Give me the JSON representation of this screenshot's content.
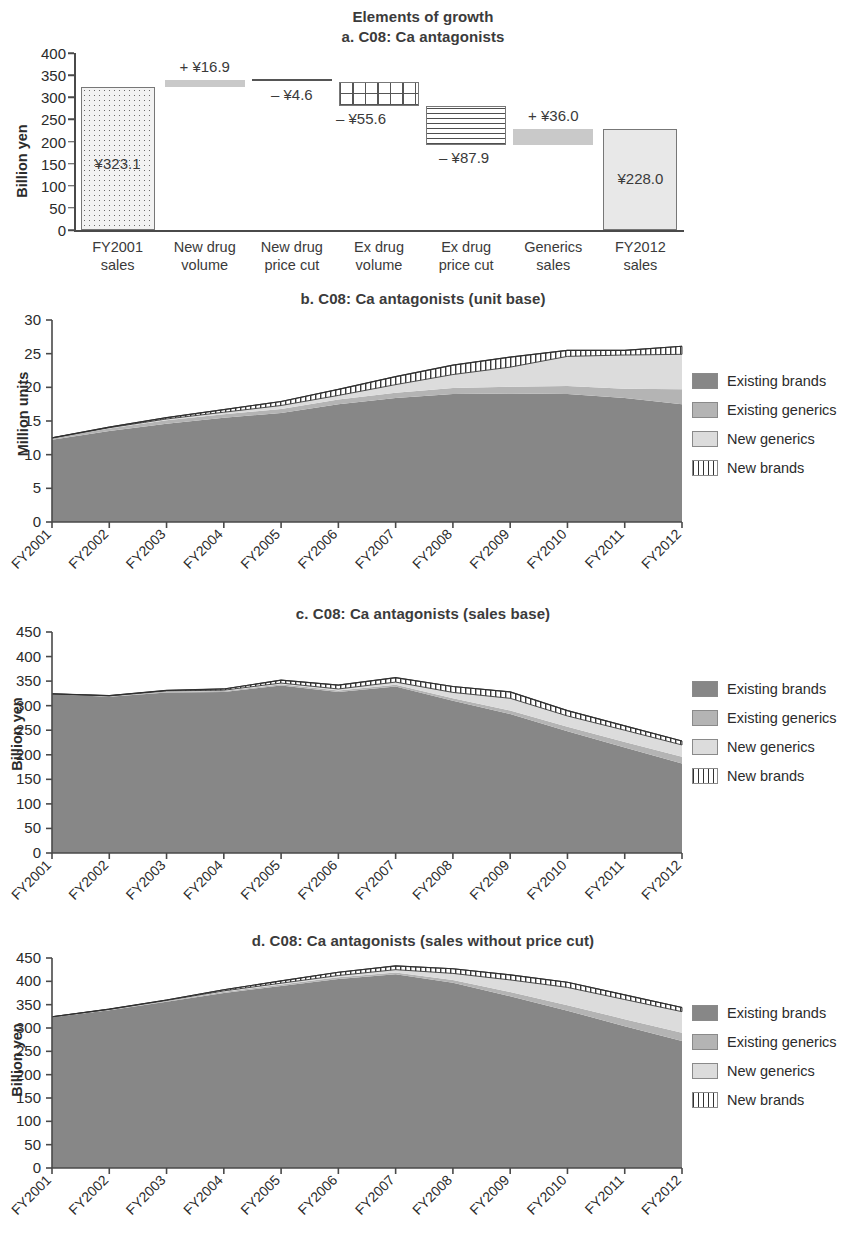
{
  "figure": {
    "main_title": "Elements of growth"
  },
  "panels": {
    "a": {
      "title": "a. C08: Ca antagonists",
      "ylabel": "Billion yen",
      "yticks": [
        "400",
        "350",
        "300",
        "250",
        "200",
        "150",
        "100",
        "50",
        "0"
      ],
      "categories": [
        "FY2001\nsales",
        "New drug\nvolume",
        "New drug\nprice cut",
        "Ex drug\nvolume",
        "Ex drug\nprice cut",
        "Generics\nsales",
        "FY2012\nsales"
      ],
      "value_labels": [
        "¥323.1",
        "+ ¥16.9",
        "– ¥4.6",
        "– ¥55.6",
        "– ¥87.9",
        "+ ¥36.0",
        "¥228.0"
      ]
    },
    "b": {
      "title": "b. C08: Ca antagonists (unit base)",
      "ylabel": "Million units"
    },
    "c": {
      "title": "c. C08: Ca antagonists (sales base)",
      "ylabel": "Billion yen"
    },
    "d": {
      "title": "d. C08: Ca antagonists (sales without price cut)",
      "ylabel": "Billion yen"
    }
  },
  "legend": {
    "items": [
      {
        "label": "Existing brands",
        "fill": "f-brands"
      },
      {
        "label": "Existing generics",
        "fill": "f-exgen"
      },
      {
        "label": "New generics",
        "fill": "f-newgen"
      },
      {
        "label": "New brands",
        "fill": "f-newbrand"
      }
    ]
  },
  "colors": {
    "existing_brands": "#878787",
    "existing_generics": "#b4b4b4",
    "new_generics": "#dcdcdc",
    "new_brands": "#ffffff",
    "axis": "#4a4a4a",
    "text": "#2b2b2b"
  },
  "chart_data": [
    {
      "type": "bar",
      "panel": "a",
      "title": "a. C08: Ca antagonists",
      "subtitle": "Elements of growth",
      "chart_style": "waterfall",
      "xlabel": "",
      "ylabel": "Billion yen",
      "ylim": [
        0,
        400
      ],
      "ytick_step": 50,
      "grid": false,
      "categories": [
        "FY2001 sales",
        "New drug volume",
        "New drug price cut",
        "Ex drug volume",
        "Ex drug price cut",
        "Generics sales",
        "FY2012 sales"
      ],
      "values": [
        323.1,
        16.9,
        -4.6,
        -55.6,
        -87.9,
        36.0,
        228.0
      ],
      "value_labels": [
        "¥323.1",
        "+ ¥16.9",
        "– ¥4.6",
        "– ¥55.6",
        "– ¥87.9",
        "+ ¥36.0",
        "¥228.0"
      ],
      "kinds": [
        "total",
        "delta",
        "delta",
        "delta",
        "delta",
        "delta",
        "total"
      ],
      "bar_spans": [
        {
          "bottom": 0.0,
          "top": 323.1
        },
        {
          "bottom": 323.1,
          "top": 340.0
        },
        {
          "bottom": 335.4,
          "top": 340.0
        },
        {
          "bottom": 279.8,
          "top": 335.4
        },
        {
          "bottom": 191.9,
          "top": 279.8
        },
        {
          "bottom": 191.9,
          "top": 227.9
        },
        {
          "bottom": 0.0,
          "top": 228.0
        }
      ],
      "fills": [
        "dots",
        "solid-gray",
        "line",
        "grid",
        "horizontal-lines",
        "solid-gray",
        "noise"
      ]
    },
    {
      "type": "area",
      "panel": "b",
      "title": "b. C08: Ca antagonists (unit base)",
      "stacked": true,
      "xlabel": "",
      "ylabel": "Million units",
      "ylim": [
        0,
        30
      ],
      "ytick_step": 5,
      "grid": false,
      "legend_position": "right",
      "x": [
        "FY2001",
        "FY2002",
        "FY2003",
        "FY2004",
        "FY2005",
        "FY2006",
        "FY2007",
        "FY2008",
        "FY2009",
        "FY2010",
        "FY2011",
        "FY2012"
      ],
      "series": [
        {
          "name": "Existing brands",
          "values": [
            12.2,
            13.5,
            14.6,
            15.5,
            16.2,
            17.5,
            18.4,
            19.0,
            19.1,
            19.0,
            18.4,
            17.5
          ]
        },
        {
          "name": "Existing generics",
          "values": [
            0.3,
            0.4,
            0.5,
            0.5,
            0.6,
            0.7,
            0.8,
            0.9,
            1.0,
            1.2,
            1.4,
            2.2
          ]
        },
        {
          "name": "New generics",
          "values": [
            0.0,
            0.1,
            0.2,
            0.3,
            0.5,
            0.6,
            1.2,
            2.0,
            2.9,
            4.4,
            5.0,
            5.2
          ]
        },
        {
          "name": "New brands",
          "values": [
            0.0,
            0.1,
            0.2,
            0.4,
            0.6,
            0.9,
            1.2,
            1.4,
            1.5,
            0.9,
            0.7,
            1.2
          ]
        }
      ],
      "totals": [
        12.5,
        14.1,
        15.5,
        16.7,
        17.9,
        19.7,
        21.6,
        23.3,
        24.5,
        25.5,
        25.5,
        26.1
      ]
    },
    {
      "type": "area",
      "panel": "c",
      "title": "c. C08: Ca antagonists (sales base)",
      "stacked": true,
      "xlabel": "",
      "ylabel": "Billion yen",
      "ylim": [
        0,
        450
      ],
      "ytick_step": 50,
      "grid": false,
      "legend_position": "right",
      "x": [
        "FY2001",
        "FY2002",
        "FY2003",
        "FY2004",
        "FY2005",
        "FY2006",
        "FY2007",
        "FY2008",
        "FY2009",
        "FY2010",
        "FY2011",
        "FY2012"
      ],
      "series": [
        {
          "name": "Existing brands",
          "values": [
            323.1,
            318.0,
            327.0,
            328.0,
            341.0,
            328.0,
            339.0,
            310.0,
            283.0,
            248.0,
            215.0,
            182.0
          ]
        },
        {
          "name": "Existing generics",
          "values": [
            1.0,
            1.5,
            2.0,
            2.0,
            2.5,
            3.0,
            3.5,
            5.0,
            7.0,
            9.0,
            11.0,
            14.0
          ]
        },
        {
          "name": "New generics",
          "values": [
            0.0,
            0.5,
            1.0,
            1.5,
            2.5,
            3.0,
            5.5,
            12.0,
            25.0,
            22.0,
            24.0,
            24.0
          ]
        },
        {
          "name": "New brands",
          "values": [
            0.0,
            0.5,
            1.0,
            2.5,
            6.0,
            8.0,
            9.0,
            12.0,
            13.0,
            11.0,
            9.0,
            8.0
          ]
        }
      ],
      "totals": [
        324.1,
        320.5,
        331.0,
        334.0,
        352.0,
        342.0,
        357.0,
        339.0,
        328.0,
        290.0,
        259.0,
        228.0
      ]
    },
    {
      "type": "area",
      "panel": "d",
      "title": "d. C08: Ca antagonists (sales without price cut)",
      "stacked": true,
      "xlabel": "",
      "ylabel": "Billion yen",
      "ylim": [
        0,
        450
      ],
      "ytick_step": 50,
      "grid": false,
      "legend_position": "right",
      "x": [
        "FY2001",
        "FY2002",
        "FY2003",
        "FY2004",
        "FY2005",
        "FY2006",
        "FY2007",
        "FY2008",
        "FY2009",
        "FY2010",
        "FY2011",
        "FY2012"
      ],
      "series": [
        {
          "name": "Existing brands",
          "values": [
            323.1,
            338.0,
            356.0,
            375.0,
            390.0,
            405.0,
            415.0,
            397.0,
            368.0,
            337.0,
            304.0,
            272.0
          ]
        },
        {
          "name": "Existing generics",
          "values": [
            1.0,
            1.5,
            2.0,
            2.5,
            3.0,
            3.5,
            4.0,
            6.0,
            9.0,
            12.0,
            15.0,
            18.0
          ]
        },
        {
          "name": "New generics",
          "values": [
            0.0,
            0.5,
            1.0,
            2.0,
            3.0,
            4.0,
            6.0,
            14.0,
            26.0,
            38.0,
            42.0,
            45.0
          ]
        },
        {
          "name": "New brands",
          "values": [
            0.0,
            0.5,
            1.0,
            2.5,
            5.0,
            7.0,
            8.0,
            10.0,
            11.0,
            11.0,
            10.0,
            9.0
          ]
        }
      ],
      "totals": [
        324.1,
        340.5,
        360.0,
        382.0,
        401.0,
        419.5,
        433.0,
        427.0,
        414.0,
        398.0,
        371.0,
        344.0
      ]
    }
  ]
}
